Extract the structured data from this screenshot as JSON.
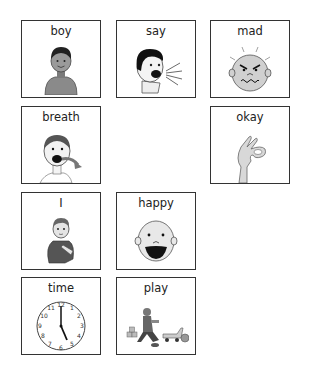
{
  "board": {
    "cards": [
      {
        "label": "boy",
        "icon": "boy-icon"
      },
      {
        "label": "say",
        "icon": "speaking-head-icon"
      },
      {
        "label": "mad",
        "icon": "angry-face-icon"
      },
      {
        "label": "breath",
        "icon": "breathing-face-icon"
      },
      {
        "label": "okay",
        "icon": "ok-hand-sign-icon"
      },
      {
        "label": "I",
        "icon": "pointing-self-icon"
      },
      {
        "label": "happy",
        "icon": "happy-face-icon"
      },
      {
        "label": "time",
        "icon": "clock-icon"
      },
      {
        "label": "play",
        "icon": "child-playing-toys-icon"
      }
    ]
  }
}
